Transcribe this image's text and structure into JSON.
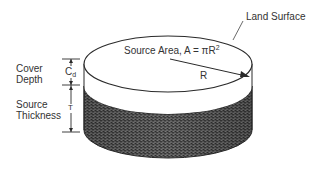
{
  "diagram": {
    "labels": {
      "land_surface": "Land Surface",
      "source_area_text": "Source Area, A = πR",
      "source_area_exponent": "2",
      "radius": "R",
      "cover_depth_line1": "Cover",
      "cover_depth_line2": "Depth",
      "cover_depth_symbol": "C",
      "cover_depth_subscript": "d",
      "source_thickness_line1": "Source",
      "source_thickness_line2": "Thickness",
      "source_thickness_symbol": "T"
    },
    "colors": {
      "outline": "#2a2a2a",
      "cover_layer": "#ffffff",
      "source_layer": "#4a4a4a",
      "source_layer_light": "#8a8a8a",
      "text": "#333333"
    },
    "geometry": {
      "center_x": 168,
      "top_ellipse_cy": 64,
      "rx": 84,
      "ry": 28,
      "cover_bottom_side_y": 86,
      "cylinder_bottom_side_y": 130
    }
  }
}
